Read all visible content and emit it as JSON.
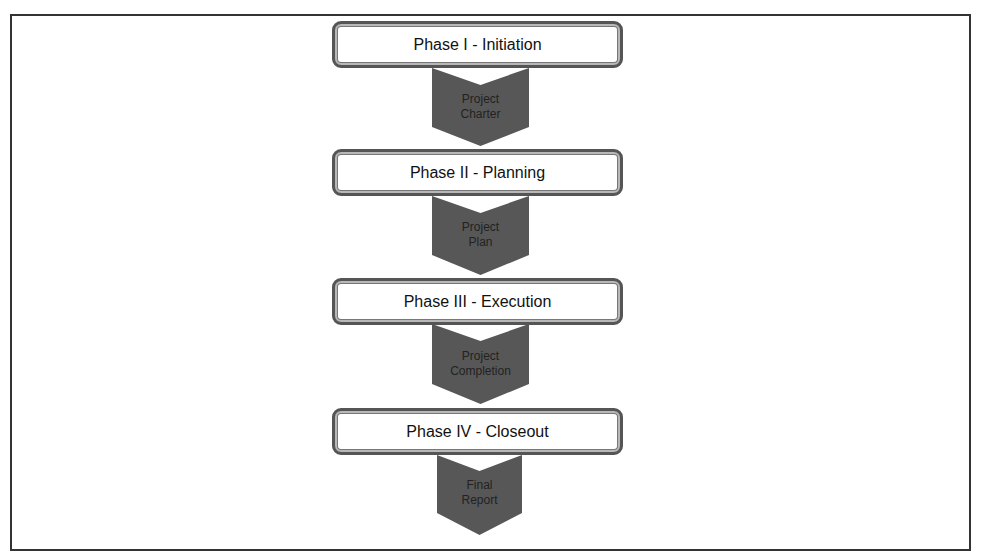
{
  "diagram": {
    "title": "",
    "phases": [
      {
        "label": "Phase I - Initiation",
        "deliverable": [
          "Project",
          "Charter"
        ]
      },
      {
        "label": "Phase II - Planning",
        "deliverable": [
          "Project",
          "Plan"
        ]
      },
      {
        "label": "Phase III - Execution",
        "deliverable": [
          "Project",
          "Completion"
        ]
      },
      {
        "label": "Phase IV - Closeout",
        "deliverable": [
          "Final",
          "Report"
        ]
      }
    ],
    "colors": {
      "arrow": "#575757",
      "box_border": "#555555",
      "frame": "#333333"
    }
  }
}
